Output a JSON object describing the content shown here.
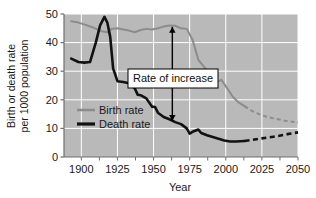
{
  "chart_data": {
    "type": "line",
    "title": "",
    "xlabel": "Year",
    "ylabel": "Birth or death rate per 1000 population",
    "ylabel_line1": "Birth or death rate",
    "ylabel_line2": "per 1000 population",
    "xlim": [
      1888,
      2050
    ],
    "ylim": [
      0,
      50
    ],
    "xticks": [
      1900,
      1925,
      1950,
      1975,
      2000,
      2025,
      2050
    ],
    "xtick_labels": [
      "1900",
      "1925",
      "1950",
      "1975",
      "2000",
      "2025",
      "2050"
    ],
    "yticks": [
      0,
      10,
      20,
      30,
      40,
      50
    ],
    "ytick_labels": [
      "0",
      "10",
      "20",
      "30",
      "40",
      "50"
    ],
    "minor_xtick_interval": 12.5,
    "grid": true,
    "grid_color": "#ffffff",
    "plot_background": "#b9b9b9",
    "legend_position": "inside-left",
    "projection_start_year": 2013,
    "series": [
      {
        "name": "Birth rate",
        "color": "#8c8c8c",
        "linewidth": 2.0,
        "legend_label": "Birth rate",
        "x": [
          1893,
          1898,
          1903,
          1908,
          1911,
          1914,
          1918,
          1921,
          1925,
          1929,
          1933,
          1937,
          1941,
          1945,
          1949,
          1953,
          1957,
          1961,
          1965,
          1969,
          1973,
          1977,
          1981,
          1985,
          1989,
          1993,
          1997,
          2001,
          2005,
          2009,
          2013
        ],
        "y": [
          47.5,
          47.0,
          46.2,
          45.3,
          44.6,
          44.0,
          43.6,
          44.8,
          45.0,
          44.6,
          44.2,
          43.6,
          44.4,
          44.8,
          44.6,
          45.0,
          45.6,
          46.0,
          45.9,
          45.0,
          44.8,
          41.0,
          34.0,
          31.5,
          28.5,
          26.0,
          27.0,
          24.0,
          21.0,
          19.0,
          17.8
        ],
        "projection_x": [
          2013,
          2017,
          2021,
          2025,
          2029,
          2033,
          2037,
          2041,
          2045,
          2050
        ],
        "projection_y": [
          17.8,
          16.4,
          15.4,
          14.6,
          14.0,
          13.5,
          13.1,
          12.7,
          12.4,
          12.1
        ]
      },
      {
        "name": "Death rate",
        "color": "#121212",
        "linewidth": 2.6,
        "legend_label": "Death rate",
        "x": [
          1893,
          1898,
          1902,
          1906,
          1910,
          1913,
          1916,
          1918,
          1920,
          1922,
          1925,
          1929,
          1933,
          1937,
          1939,
          1941,
          1945,
          1949,
          1951,
          1953,
          1957,
          1961,
          1965,
          1969,
          1973,
          1975,
          1977,
          1981,
          1983,
          1987,
          1991,
          1995,
          1999,
          2003,
          2007,
          2013
        ],
        "y": [
          34.4,
          33.2,
          33.0,
          33.2,
          40.0,
          46.0,
          49.0,
          47.0,
          42.0,
          31.0,
          26.5,
          26.2,
          25.8,
          24.0,
          21.8,
          21.6,
          20.5,
          17.6,
          17.5,
          15.5,
          14.0,
          13.2,
          12.2,
          11.5,
          10.0,
          8.2,
          8.8,
          9.6,
          8.4,
          7.6,
          7.0,
          6.4,
          5.8,
          5.4,
          5.4,
          5.6
        ],
        "projection_x": [
          2013,
          2017,
          2021,
          2025,
          2029,
          2033,
          2037,
          2041,
          2045,
          2050
        ],
        "projection_y": [
          5.6,
          5.9,
          6.2,
          6.5,
          6.8,
          7.1,
          7.4,
          7.8,
          8.2,
          8.6
        ]
      }
    ],
    "annotations": [
      {
        "name": "rate-of-increase",
        "text": "Rate of increase",
        "x": 1963,
        "y_top": 45.5,
        "y_bottom": 12.6,
        "arrow": "double-headed-vertical",
        "box": true,
        "box_fill": "#ffffff",
        "box_border": "#000000"
      }
    ]
  }
}
